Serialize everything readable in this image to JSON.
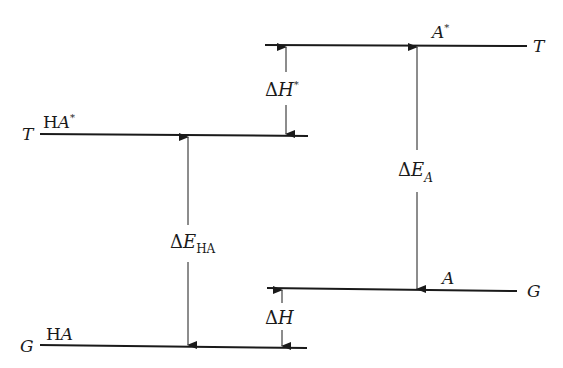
{
  "diagram": {
    "type": "energy-level-diagram",
    "levels": [
      {
        "id": "A-excited",
        "species": "A",
        "superscript": "*",
        "state": "T"
      },
      {
        "id": "HA-excited",
        "species_prefix": "H",
        "species": "A",
        "superscript": "*",
        "state": "T"
      },
      {
        "id": "A-ground",
        "species": "A",
        "state": "G"
      },
      {
        "id": "HA-ground",
        "species_prefix": "H",
        "species": "A",
        "state": "G"
      }
    ],
    "transitions": [
      {
        "id": "dH-star",
        "symbol": "Δ",
        "var": "H",
        "sup": "*",
        "from": "HA-excited",
        "to": "A-excited"
      },
      {
        "id": "dE-HA",
        "symbol": "Δ",
        "var": "E",
        "sub": "HA",
        "from": "HA-ground",
        "to": "HA-excited"
      },
      {
        "id": "dE-A",
        "symbol": "Δ",
        "var": "E",
        "sub": "A",
        "from": "A-excited",
        "to": "A-ground"
      },
      {
        "id": "dH",
        "symbol": "Δ",
        "var": "H",
        "from": "HA-ground",
        "to": "A-ground"
      }
    ]
  }
}
